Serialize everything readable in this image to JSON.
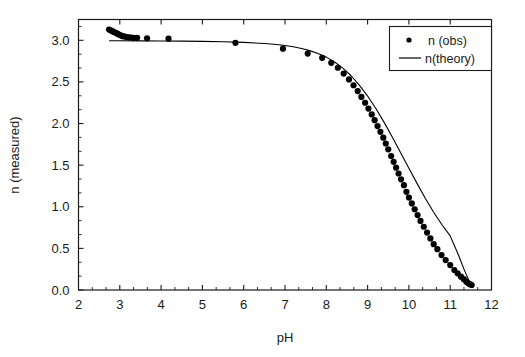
{
  "chart_data": {
    "type": "scatter",
    "title": "",
    "xlabel": "pH",
    "ylabel": "n (measured)",
    "xlim": [
      2,
      12
    ],
    "ylim": [
      0.0,
      3.25
    ],
    "xticks": [
      "2",
      "3",
      "4",
      "5",
      "6",
      "7",
      "8",
      "9",
      "10",
      "11",
      "12"
    ],
    "yticks": [
      "0.0",
      "0.5",
      "1.0",
      "1.5",
      "2.0",
      "2.5",
      "3.0"
    ],
    "xtick_values": [
      2,
      3,
      4,
      5,
      6,
      7,
      8,
      9,
      10,
      11,
      12
    ],
    "ytick_values": [
      0.0,
      0.5,
      1.0,
      1.5,
      2.0,
      2.5,
      3.0
    ],
    "x_minor_ticks_per_interval": 2,
    "y_minor_ticks_per_interval": 2,
    "grid": false,
    "legend_position": "top-right",
    "legend_border": true,
    "series": [
      {
        "name": "n (obs)",
        "marker": "filled-circle",
        "marker_size": 3.1,
        "color": "#000000",
        "points": [
          [
            2.74,
            3.13
          ],
          [
            2.78,
            3.12
          ],
          [
            2.82,
            3.11
          ],
          [
            2.86,
            3.1
          ],
          [
            2.9,
            3.09
          ],
          [
            2.94,
            3.08
          ],
          [
            2.98,
            3.07
          ],
          [
            3.02,
            3.06
          ],
          [
            3.07,
            3.05
          ],
          [
            3.12,
            3.045
          ],
          [
            3.18,
            3.04
          ],
          [
            3.25,
            3.035
          ],
          [
            3.33,
            3.03
          ],
          [
            3.42,
            3.03
          ],
          [
            3.66,
            3.025
          ],
          [
            4.18,
            3.02
          ],
          [
            5.8,
            2.97
          ],
          [
            6.95,
            2.9
          ],
          [
            7.55,
            2.84
          ],
          [
            7.9,
            2.79
          ],
          [
            8.12,
            2.73
          ],
          [
            8.28,
            2.67
          ],
          [
            8.42,
            2.6
          ],
          [
            8.55,
            2.53
          ],
          [
            8.66,
            2.46
          ],
          [
            8.76,
            2.39
          ],
          [
            8.85,
            2.32
          ],
          [
            8.94,
            2.25
          ],
          [
            9.02,
            2.18
          ],
          [
            9.1,
            2.11
          ],
          [
            9.17,
            2.04
          ],
          [
            9.24,
            1.97
          ],
          [
            9.31,
            1.9
          ],
          [
            9.38,
            1.83
          ],
          [
            9.44,
            1.76
          ],
          [
            9.5,
            1.69
          ],
          [
            9.57,
            1.61
          ],
          [
            9.63,
            1.54
          ],
          [
            9.69,
            1.47
          ],
          [
            9.75,
            1.4
          ],
          [
            9.81,
            1.33
          ],
          [
            9.88,
            1.26
          ],
          [
            9.94,
            1.18
          ],
          [
            10.0,
            1.11
          ],
          [
            10.07,
            1.04
          ],
          [
            10.14,
            0.97
          ],
          [
            10.21,
            0.9
          ],
          [
            10.28,
            0.83
          ],
          [
            10.36,
            0.76
          ],
          [
            10.44,
            0.69
          ],
          [
            10.52,
            0.62
          ],
          [
            10.6,
            0.55
          ],
          [
            10.69,
            0.49
          ],
          [
            10.79,
            0.42
          ],
          [
            10.89,
            0.36
          ],
          [
            11.0,
            0.3
          ],
          [
            11.1,
            0.24
          ],
          [
            11.18,
            0.2
          ],
          [
            11.26,
            0.16
          ],
          [
            11.33,
            0.13
          ],
          [
            11.39,
            0.1
          ],
          [
            11.44,
            0.08
          ],
          [
            11.48,
            0.07
          ],
          [
            11.52,
            0.06
          ]
        ]
      },
      {
        "name": "n(theory)",
        "marker": "line",
        "line_width": 1.1,
        "color": "#000000",
        "points": [
          [
            2.75,
            2.995
          ],
          [
            3.0,
            2.995
          ],
          [
            3.5,
            2.993
          ],
          [
            4.0,
            2.992
          ],
          [
            4.5,
            2.99
          ],
          [
            5.0,
            2.987
          ],
          [
            5.5,
            2.982
          ],
          [
            6.0,
            2.975
          ],
          [
            6.5,
            2.962
          ],
          [
            6.8,
            2.95
          ],
          [
            7.0,
            2.938
          ],
          [
            7.2,
            2.922
          ],
          [
            7.4,
            2.902
          ],
          [
            7.6,
            2.876
          ],
          [
            7.8,
            2.842
          ],
          [
            8.0,
            2.798
          ],
          [
            8.2,
            2.74
          ],
          [
            8.4,
            2.666
          ],
          [
            8.6,
            2.574
          ],
          [
            8.8,
            2.462
          ],
          [
            9.0,
            2.33
          ],
          [
            9.2,
            2.18
          ],
          [
            9.4,
            2.014
          ],
          [
            9.6,
            1.836
          ],
          [
            9.8,
            1.65
          ],
          [
            10.0,
            1.462
          ],
          [
            10.2,
            1.278
          ],
          [
            10.4,
            1.1
          ],
          [
            10.6,
            0.934
          ],
          [
            10.8,
            0.784
          ],
          [
            11.0,
            0.65
          ],
          [
            11.2,
            0.42
          ],
          [
            11.35,
            0.23
          ],
          [
            11.45,
            0.12
          ],
          [
            11.52,
            0.06
          ]
        ]
      }
    ],
    "legend_entries": [
      {
        "label": "n (obs)",
        "marker": "dot"
      },
      {
        "label": "n(theory)",
        "marker": "line"
      }
    ]
  },
  "axes": {
    "x_title": "pH",
    "y_title": "n (measured)"
  },
  "colors": {
    "background": "#ffffff",
    "foreground": "#1a1a1a",
    "data": "#000000",
    "axis": "#1a1a1a"
  }
}
